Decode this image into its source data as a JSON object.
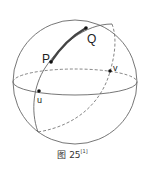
{
  "figure": {
    "caption_prefix": "图 25",
    "caption_ref": "[1]"
  },
  "points": {
    "P": {
      "label": "P",
      "x": 51,
      "y": 62
    },
    "Q": {
      "label": "Q",
      "x": 86,
      "y": 28
    },
    "u": {
      "label": "u",
      "x": 39,
      "y": 91
    },
    "v": {
      "label": "v",
      "x": 110,
      "y": 71
    }
  },
  "colors": {
    "stroke": "#555555",
    "highlight": "#444444",
    "point": "#111111"
  }
}
